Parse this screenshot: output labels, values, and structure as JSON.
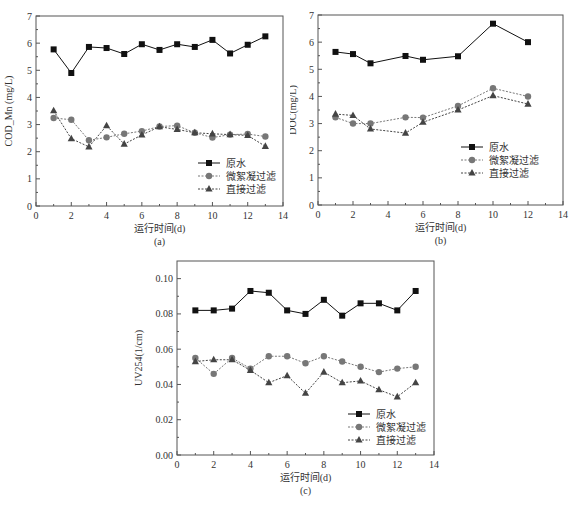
{
  "figure": {
    "panels": [
      "(a)",
      "(b)",
      "(c)"
    ]
  },
  "legend": {
    "raw_water": "原水",
    "microfloc": "微絮凝过滤",
    "direct": "直接过滤"
  },
  "chart_data": [
    {
      "type": "line",
      "panel_label": "(a)",
      "title": "",
      "xlabel": "运行时间(d)",
      "ylabel": "COD_Mn (mg/L)",
      "xlim": [
        0,
        14
      ],
      "ylim": [
        0,
        7
      ],
      "xticks": [
        0,
        2,
        4,
        6,
        8,
        10,
        12,
        14
      ],
      "yticks": [
        0,
        1,
        2,
        3,
        4,
        5,
        6,
        7
      ],
      "grid": false,
      "legend_position": "lower right",
      "x": [
        1,
        2,
        3,
        4,
        5,
        6,
        7,
        8,
        9,
        10,
        11,
        12,
        13
      ],
      "series": [
        {
          "name": "原水",
          "marker": "square",
          "line": "solid",
          "values": [
            5.77,
            4.9,
            5.86,
            5.82,
            5.6,
            5.96,
            5.75,
            5.96,
            5.86,
            6.12,
            5.62,
            5.94,
            6.25
          ]
        },
        {
          "name": "微絮凝过滤",
          "marker": "circle",
          "line": "dotted",
          "values": [
            3.24,
            3.18,
            2.42,
            2.53,
            2.66,
            2.76,
            2.93,
            2.96,
            2.7,
            2.52,
            2.63,
            2.65,
            2.56
          ]
        },
        {
          "name": "直接过滤",
          "marker": "triangle",
          "line": "dotted",
          "values": [
            3.51,
            2.48,
            2.18,
            2.96,
            2.28,
            2.62,
            2.92,
            2.82,
            2.7,
            2.66,
            2.63,
            2.6,
            2.2
          ]
        }
      ]
    },
    {
      "type": "line",
      "panel_label": "(b)",
      "title": "",
      "xlabel": "运行时间(d)",
      "ylabel": "DOC(mg/L)",
      "xlim": [
        0,
        14
      ],
      "ylim": [
        0,
        7
      ],
      "xticks": [
        0,
        2,
        4,
        6,
        8,
        10,
        12,
        14
      ],
      "yticks": [
        0,
        1,
        2,
        3,
        4,
        5,
        6,
        7
      ],
      "grid": false,
      "legend_position": "lower right",
      "x": [
        1,
        2,
        3,
        5,
        6,
        8,
        10,
        12
      ],
      "series": [
        {
          "name": "原水",
          "marker": "square",
          "line": "solid",
          "values": [
            5.64,
            5.56,
            5.22,
            5.49,
            5.35,
            5.48,
            6.68,
            6.0
          ]
        },
        {
          "name": "微絮凝过滤",
          "marker": "circle",
          "line": "dotted",
          "values": [
            3.23,
            3.0,
            3.0,
            3.23,
            3.22,
            3.65,
            4.3,
            4.0
          ]
        },
        {
          "name": "直接过滤",
          "marker": "triangle",
          "line": "dotted",
          "values": [
            3.35,
            3.3,
            2.8,
            2.65,
            3.05,
            3.5,
            4.03,
            3.72
          ]
        }
      ]
    },
    {
      "type": "line",
      "panel_label": "(c)",
      "title": "",
      "xlabel": "运行时间(d)",
      "ylabel": "UV254(1/cm)",
      "xlim": [
        0,
        14
      ],
      "ylim": [
        0,
        0.11
      ],
      "xticks": [
        0,
        2,
        4,
        6,
        8,
        10,
        12,
        14
      ],
      "yticks": [
        0.0,
        0.02,
        0.04,
        0.06,
        0.08,
        0.1
      ],
      "ytick_labels": [
        "0.00",
        "0.02",
        "0.04",
        "0.06",
        "0.08",
        "0.10"
      ],
      "grid": false,
      "legend_position": "lower right",
      "x": [
        1,
        2,
        3,
        4,
        5,
        6,
        7,
        8,
        9,
        10,
        11,
        12,
        13
      ],
      "series": [
        {
          "name": "原水",
          "marker": "square",
          "line": "solid",
          "values": [
            0.082,
            0.082,
            0.083,
            0.093,
            0.092,
            0.082,
            0.08,
            0.088,
            0.079,
            0.086,
            0.086,
            0.082,
            0.093
          ]
        },
        {
          "name": "微絮凝过滤",
          "marker": "circle",
          "line": "dotted",
          "values": [
            0.055,
            0.046,
            0.055,
            0.049,
            0.056,
            0.056,
            0.052,
            0.056,
            0.053,
            0.05,
            0.047,
            0.049,
            0.05
          ]
        },
        {
          "name": "直接过滤",
          "marker": "triangle",
          "line": "dotted",
          "values": [
            0.053,
            0.054,
            0.054,
            0.048,
            0.041,
            0.045,
            0.035,
            0.047,
            0.041,
            0.042,
            0.037,
            0.033,
            0.041
          ]
        }
      ]
    }
  ]
}
